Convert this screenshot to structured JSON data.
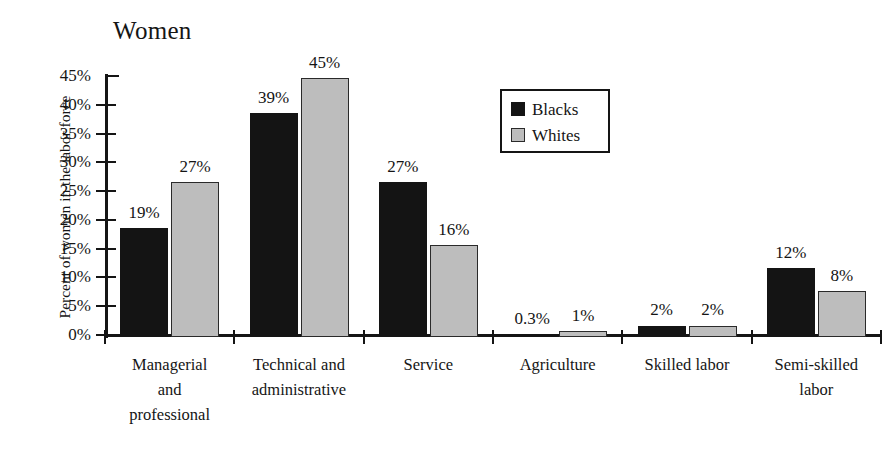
{
  "chart_data": {
    "type": "bar",
    "title": "Women",
    "xlabel": "",
    "ylabel": "Percent of women in the labor force",
    "ylim": [
      0,
      45
    ],
    "ytick_labels": [
      "45%",
      "40%",
      "35%",
      "30%",
      "25%",
      "20%",
      "15%",
      "10%",
      "5%",
      "0%"
    ],
    "ytick_values": [
      45,
      40,
      35,
      30,
      25,
      20,
      15,
      10,
      5,
      0
    ],
    "grid": false,
    "legend_position": "upper-center",
    "categories": [
      "Managerial and professional",
      "Technical and administrative",
      "Service",
      "Agriculture",
      "Skilled labor",
      "Semi-skilled labor"
    ],
    "category_lines": [
      [
        "Managerial",
        "and",
        "professional"
      ],
      [
        "Technical and",
        "administrative"
      ],
      [
        "Service"
      ],
      [
        "Agriculture"
      ],
      [
        "Skilled labor"
      ],
      [
        "Semi-skilled",
        "labor"
      ]
    ],
    "series": [
      {
        "name": "Blacks",
        "color": "#141414",
        "values": [
          19,
          39,
          27,
          0.3,
          2,
          12
        ],
        "labels": [
          "19%",
          "39%",
          "27%",
          "0.3%",
          "2%",
          "12%"
        ]
      },
      {
        "name": "Whites",
        "color": "#bdbdbd",
        "values": [
          27,
          45,
          16,
          1,
          2,
          8
        ],
        "labels": [
          "27%",
          "45%",
          "16%",
          "1%",
          "2%",
          "8%"
        ]
      }
    ]
  },
  "legend": {
    "items": [
      {
        "label": "Blacks",
        "swatch": "black"
      },
      {
        "label": "Whites",
        "swatch": "gray"
      }
    ]
  }
}
